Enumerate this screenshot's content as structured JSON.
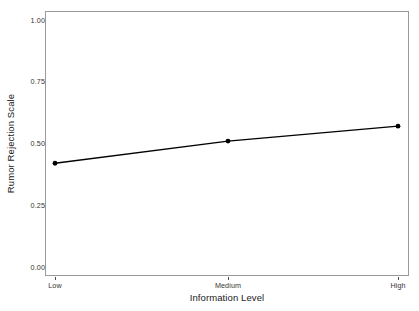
{
  "chart_data": {
    "type": "line",
    "title": "",
    "subtitle": "",
    "xlabel": "Information Level",
    "ylabel": "Rumor Rejection Scale",
    "categories": [
      "Low",
      "Medium",
      "High"
    ],
    "values": [
      0.42,
      0.51,
      0.57
    ],
    "series": [
      {
        "name": "Rumor Rejection Scale",
        "values": [
          0.42,
          0.51,
          0.57
        ]
      }
    ],
    "ylim": [
      0.0,
      1.0
    ],
    "yticks": [
      0.0,
      0.25,
      0.5,
      0.75,
      1.0
    ],
    "ytick_labels": [
      "0.00",
      "0.25",
      "0.50",
      "0.75",
      "1.00"
    ],
    "xtick_labels": [
      "Low",
      "Medium",
      "High"
    ],
    "grid": false,
    "legend": "none",
    "line_color": "#000000",
    "marker": "circle",
    "marker_color": "#000000",
    "panel_background": "#ffffff",
    "panel_border_color": "#9a9a9a",
    "annotations": []
  }
}
